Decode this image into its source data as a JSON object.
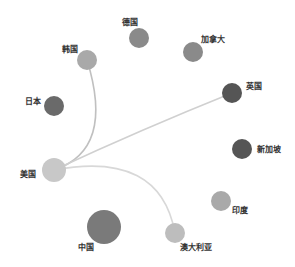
{
  "graph": {
    "type": "network",
    "nodes": [
      {
        "id": "usa_hub",
        "label": "美国",
        "x": 54,
        "y": 170,
        "r": 12,
        "color": "#c8c8c8",
        "label_x": 20,
        "label_y": 170
      },
      {
        "id": "korea",
        "label": "韩国",
        "x": 87,
        "y": 60,
        "r": 10,
        "color": "#a9a9a9",
        "label_x": 62,
        "label_y": 45
      },
      {
        "id": "germany",
        "label": "德国",
        "x": 139,
        "y": 38,
        "r": 10,
        "color": "#8a8a8a",
        "label_x": 122,
        "label_y": 18
      },
      {
        "id": "canada",
        "label": "加拿大",
        "x": 193,
        "y": 52,
        "r": 10,
        "color": "#8a8a8a",
        "label_x": 201,
        "label_y": 35
      },
      {
        "id": "japan",
        "label": "日本",
        "x": 54,
        "y": 106,
        "r": 10,
        "color": "#6a6a6a",
        "label_x": 25,
        "label_y": 97
      },
      {
        "id": "uk",
        "label": "英国",
        "x": 232,
        "y": 93,
        "r": 10,
        "color": "#555555",
        "label_x": 246,
        "label_y": 82
      },
      {
        "id": "singapore",
        "label": "新加坡",
        "x": 242,
        "y": 149,
        "r": 10,
        "color": "#555555",
        "label_x": 257,
        "label_y": 145
      },
      {
        "id": "india",
        "label": "印度",
        "x": 221,
        "y": 201,
        "r": 10,
        "color": "#a9a9a9",
        "label_x": 232,
        "label_y": 206
      },
      {
        "id": "australia",
        "label": "澳大利亚",
        "x": 175,
        "y": 233,
        "r": 10,
        "color": "#bdbdbd",
        "label_x": 180,
        "label_y": 243
      },
      {
        "id": "china",
        "label": "中国",
        "x": 104,
        "y": 227,
        "r": 17,
        "color": "#7a7a7a",
        "label_x": 78,
        "label_y": 243
      }
    ],
    "edges": [
      {
        "source": "usa_hub",
        "target": "korea",
        "path": "M 54 170 Q 115 150 87 60",
        "color": "#c0c0c0"
      },
      {
        "source": "usa_hub",
        "target": "uk",
        "path": "M 54 170 Q 140 130 232 93",
        "color": "#d0d0d0"
      },
      {
        "source": "usa_hub",
        "target": "australia",
        "path": "M 54 170 Q 160 150 175 233",
        "color": "#d8d8d8"
      }
    ]
  }
}
